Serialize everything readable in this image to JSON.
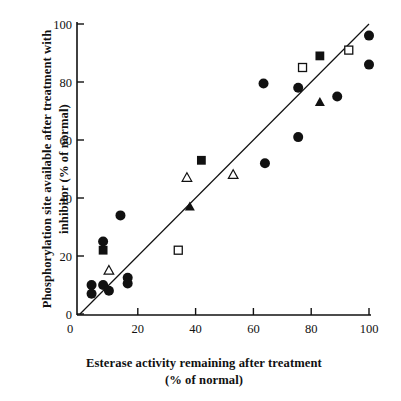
{
  "chart_data": {
    "type": "scatter",
    "title": "",
    "xlabel": "Esterase activity remaining after treatment",
    "xlabel_line2": "(% of normal)",
    "ylabel": "Phosphorylation site available after treatment",
    "ylabel_line2": "with inhibitor (% of normal)",
    "xlim": [
      0,
      100
    ],
    "ylim": [
      0,
      100
    ],
    "xticks": [
      0,
      20,
      40,
      60,
      80,
      100
    ],
    "yticks": [
      0,
      20,
      40,
      60,
      80,
      100
    ],
    "xtick_labels": [
      "0",
      "20",
      "40",
      "60",
      "80",
      "100"
    ],
    "ytick_labels": [
      "0",
      "20",
      "40",
      "60",
      "80",
      "100"
    ],
    "grid": false,
    "legend": "none",
    "reference_line": {
      "name": "identity-line",
      "from": [
        0,
        0
      ],
      "to": [
        100,
        100
      ],
      "color": "#111111"
    },
    "series": [
      {
        "name": "filled-circle",
        "marker": "filled-circle",
        "color": "#111111",
        "points": [
          [
            4,
            10
          ],
          [
            4,
            7
          ],
          [
            8,
            10
          ],
          [
            10,
            8
          ],
          [
            8,
            25
          ],
          [
            14,
            34
          ],
          [
            16.5,
            12.5
          ],
          [
            16.5,
            10.5
          ],
          [
            64,
            52
          ],
          [
            63.5,
            79.5
          ],
          [
            75.5,
            78
          ],
          [
            75.5,
            61
          ],
          [
            89,
            75
          ],
          [
            100,
            96
          ],
          [
            100,
            86
          ]
        ]
      },
      {
        "name": "filled-square",
        "marker": "filled-square",
        "color": "#111111",
        "points": [
          [
            8,
            22
          ],
          [
            42,
            53
          ],
          [
            83,
            89
          ]
        ]
      },
      {
        "name": "open-square",
        "marker": "open-square",
        "color": "#111111",
        "points": [
          [
            34,
            22
          ],
          [
            77,
            85
          ],
          [
            93,
            91
          ]
        ]
      },
      {
        "name": "filled-triangle",
        "marker": "filled-triangle",
        "color": "#111111",
        "points": [
          [
            38,
            37
          ],
          [
            83,
            73
          ]
        ]
      },
      {
        "name": "open-triangle",
        "marker": "open-triangle",
        "color": "#111111",
        "points": [
          [
            10,
            15
          ],
          [
            37,
            47
          ],
          [
            53,
            48
          ]
        ]
      }
    ]
  },
  "axes": {
    "x_tick_labels": [
      "0",
      "20",
      "40",
      "60",
      "80",
      "100"
    ],
    "y_tick_labels": [
      "0",
      "20",
      "40",
      "60",
      "80",
      "100"
    ]
  }
}
